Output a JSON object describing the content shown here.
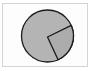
{
  "chart_data": {
    "type": "pie",
    "title": "",
    "labels": [
      "Slice A",
      "Slice B"
    ],
    "values": [
      75,
      25
    ],
    "colors": [
      "#b4b4b4",
      "#acacac"
    ],
    "edge_color": "#1a1a1a",
    "start_angle_deg": -24,
    "legend": false,
    "center": [
      47.5,
      36
    ],
    "radius": 26,
    "explode_offset": [
      0,
      1
    ]
  },
  "frame": {
    "border_color": "#d4d4d4",
    "background": "#fdfdfd"
  }
}
